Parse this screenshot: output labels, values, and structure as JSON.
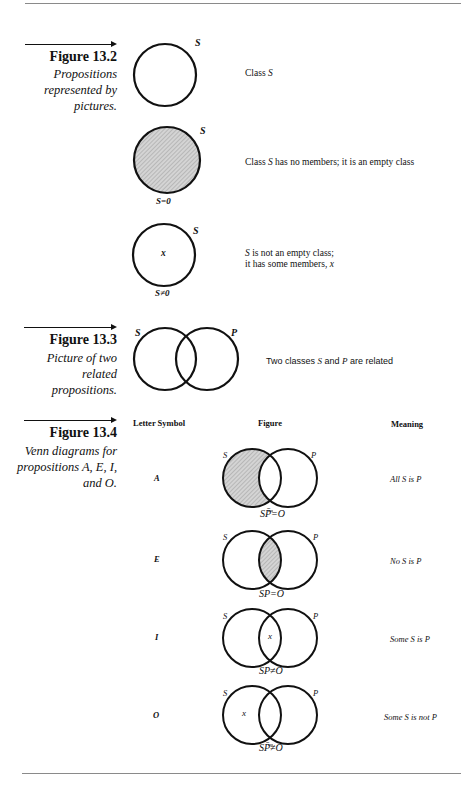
{
  "page": {
    "figures": [
      {
        "title": "Figure 13.2",
        "caption": "Propositions represented by pictures.",
        "items": [
          {
            "diagram_label": "S",
            "diagram_sublabel": "",
            "description_prefix": "Class ",
            "description_var": "S",
            "description_suffix": ""
          },
          {
            "diagram_label": "S",
            "diagram_sublabel": "S=0",
            "description_prefix": "Class ",
            "description_var": "S",
            "description_suffix": " has no members; it is an empty class"
          },
          {
            "diagram_label": "S",
            "diagram_sublabel": "S≠0",
            "member_mark": "x",
            "description_line1_var": "S",
            "description_line1": " is not an empty class;",
            "description_line2": "it has some members, ",
            "description_line2_var": "x"
          }
        ]
      },
      {
        "title": "Figure 13.3",
        "caption": "Picture of two related propositions.",
        "labels": [
          "S",
          "P"
        ],
        "description_prefix": "Two classes ",
        "description_var1": "S",
        "description_mid": " and ",
        "description_var2": "P",
        "description_suffix": " are related"
      },
      {
        "title": "Figure 13.4",
        "caption": "Venn diagrams for propositions A, E, I, and O.",
        "columns": [
          "Letter Symbol",
          "Figure",
          "Meaning"
        ],
        "rows": [
          {
            "symbol": "A",
            "formula": "SP̄=O",
            "meaning": "All S is P",
            "shaded": "S-only",
            "mark": ""
          },
          {
            "symbol": "E",
            "formula": "SP=O",
            "meaning": "No S is P",
            "shaded": "intersection",
            "mark": ""
          },
          {
            "symbol": "I",
            "formula": "SP≠O",
            "meaning": "Some S is P",
            "shaded": "none",
            "mark": "x"
          },
          {
            "symbol": "O",
            "formula": "SP̄≠O",
            "meaning": "Some S is not P",
            "shaded": "none",
            "mark": "x"
          }
        ],
        "circle_labels": [
          "S",
          "P"
        ]
      }
    ]
  }
}
